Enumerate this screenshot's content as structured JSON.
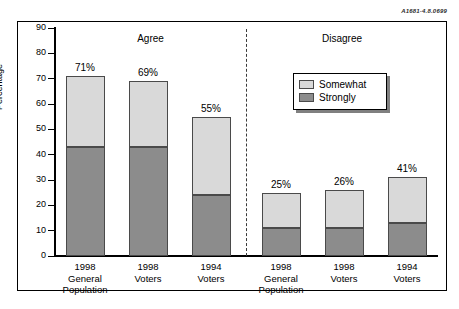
{
  "reference_code": "A1681-4.8.0699",
  "chart_data": {
    "type": "bar",
    "subtype": "stacked-bar",
    "title": "",
    "xlabel": "",
    "ylabel": "Percentage",
    "ylim": [
      0,
      90
    ],
    "ytick_step": 10,
    "yticks": [
      90,
      80,
      70,
      60,
      50,
      40,
      30,
      20,
      10,
      0
    ],
    "grid": false,
    "legend_position": "upper-right-inside",
    "group_headers": [
      "Agree",
      "Disagree"
    ],
    "divider": "dashed",
    "categories": [
      {
        "line1": "1998",
        "line2": "General",
        "line3": "Population"
      },
      {
        "line1": "1998",
        "line2": "Voters",
        "line3": ""
      },
      {
        "line1": "1994",
        "line2": "Voters",
        "line3": ""
      },
      {
        "line1": "1998",
        "line2": "General",
        "line3": "Population"
      },
      {
        "line1": "1998",
        "line2": "Voters",
        "line3": ""
      },
      {
        "line1": "1994",
        "line2": "Voters",
        "line3": ""
      }
    ],
    "series": [
      {
        "name": "Strongly",
        "color": "#8c8c8c",
        "values": [
          43,
          43,
          24,
          11,
          11,
          13
        ]
      },
      {
        "name": "Somewhat",
        "color": "#d9d9d9",
        "values": [
          28,
          26,
          31,
          14,
          15,
          18
        ]
      }
    ],
    "totals": [
      71,
      69,
      55,
      25,
      26,
      31
    ],
    "data_labels": [
      "71%",
      "69%",
      "55%",
      "25%",
      "26%",
      "41%"
    ]
  },
  "legend": {
    "items": [
      {
        "label": "Somewhat",
        "color": "#d9d9d9"
      },
      {
        "label": "Strongly",
        "color": "#8c8c8c"
      }
    ]
  },
  "colors": {
    "somewhat": "#d9d9d9",
    "strongly": "#8c8c8c",
    "axis": "#000000",
    "background": "#ffffff"
  }
}
